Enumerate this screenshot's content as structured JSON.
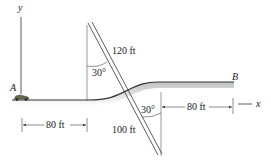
{
  "diagram": {
    "axes": {
      "y_label": "y",
      "x_label": "x"
    },
    "points": {
      "start": "A",
      "end": "B"
    },
    "dimensions": {
      "left_horizontal": "80 ft",
      "right_horizontal": "80 ft",
      "upper_diagonal": "120 ft",
      "lower_diagonal": "100 ft"
    },
    "angles": {
      "upper": "30°",
      "lower": "30°"
    }
  }
}
